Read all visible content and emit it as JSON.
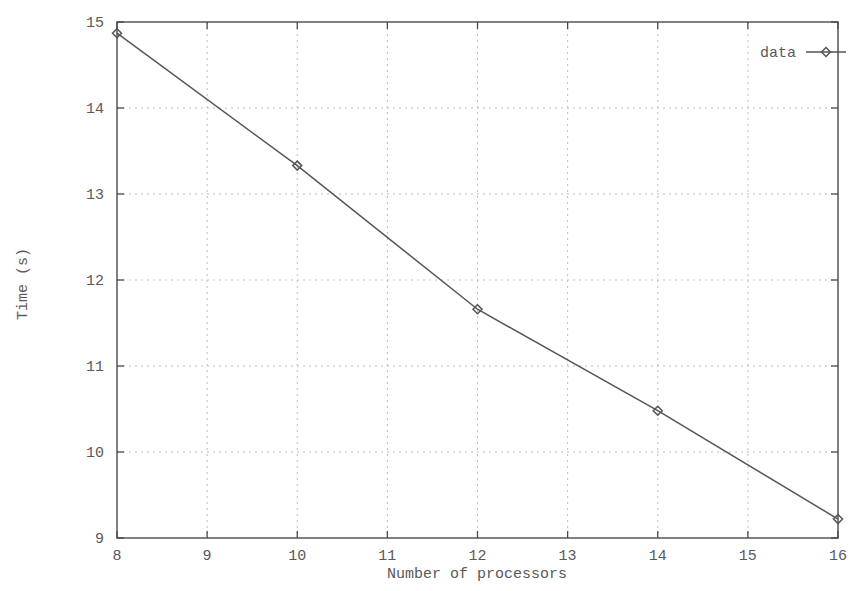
{
  "chart_data": {
    "type": "line",
    "title": "",
    "xlabel": "Number of processors",
    "ylabel": "Time (s)",
    "xlim": [
      8,
      16
    ],
    "ylim": [
      9,
      15
    ],
    "xticks": [
      8,
      9,
      10,
      11,
      12,
      13,
      14,
      15,
      16
    ],
    "yticks": [
      9,
      10,
      11,
      12,
      13,
      14,
      15
    ],
    "xtick_labels": [
      "8",
      "9",
      "10",
      "11",
      "12",
      "13",
      "14",
      "15",
      "16"
    ],
    "ytick_labels": [
      "9",
      "10",
      "11",
      "12",
      "13",
      "14",
      "15"
    ],
    "grid": true,
    "grid_style": "dotted",
    "legend_position": "top-right",
    "series": [
      {
        "name": "data",
        "marker": "diamond",
        "color": "#555555",
        "x": [
          8,
          10,
          12,
          14,
          16
        ],
        "values": [
          14.87,
          13.33,
          11.66,
          10.48,
          9.22
        ]
      }
    ]
  },
  "legend": {
    "entries": [
      {
        "label": "data"
      }
    ]
  },
  "axes": {
    "x_title": "Number of processors",
    "y_title": "Time (s)"
  },
  "colors": {
    "line": "#555555",
    "axis": "#4a4a4a",
    "grid": "#bdbdbd",
    "text": "#595959",
    "background": "#ffffff"
  }
}
